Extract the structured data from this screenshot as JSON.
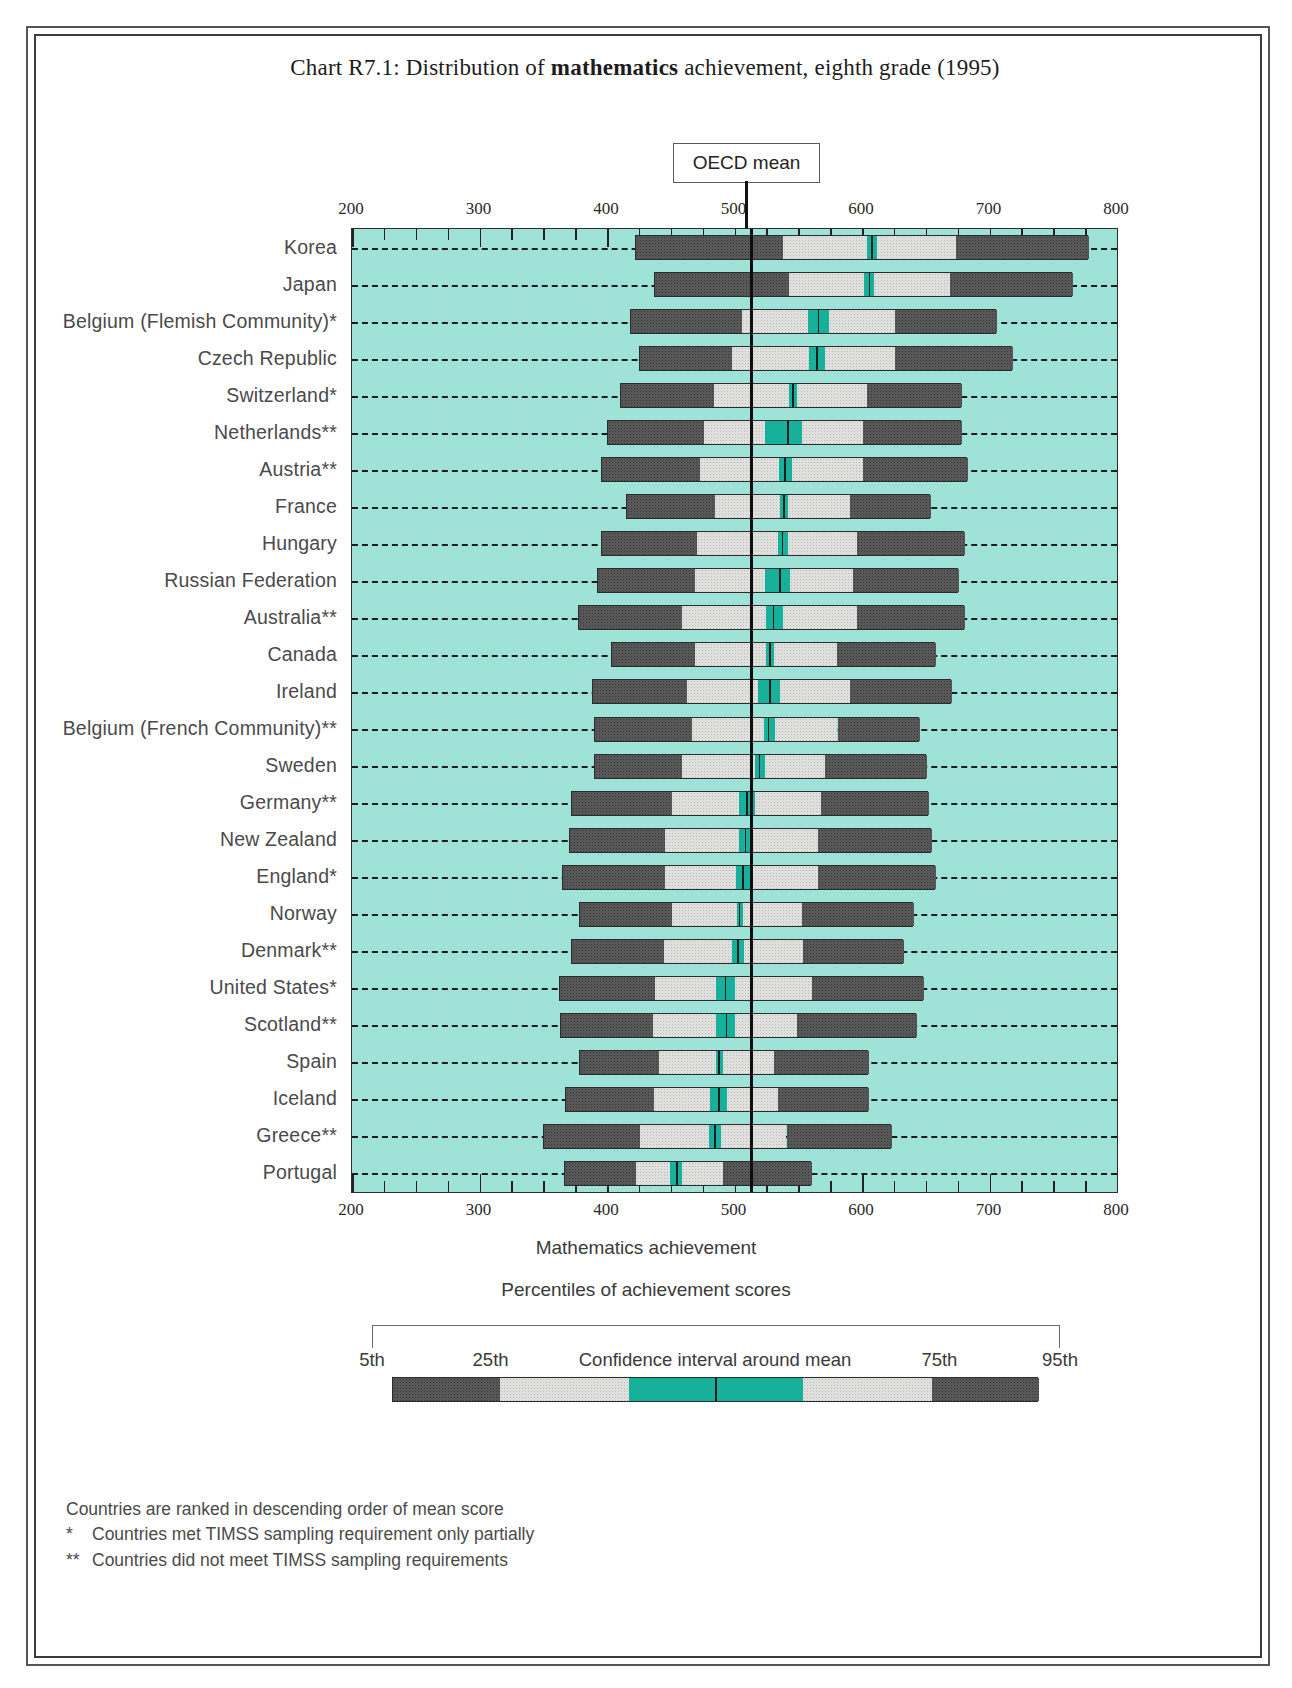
{
  "title": {
    "prefix": "Chart R7.1: Distribution of ",
    "bold": "mathematics",
    "suffix": " achievement, eighth grade (1995)"
  },
  "oecd_mean_label": "OECD mean",
  "axis": {
    "xlabel": "Mathematics achievement",
    "tick_labels": [
      "200",
      "300",
      "400",
      "500",
      "600",
      "700",
      "800"
    ]
  },
  "legend": {
    "caption": "Percentiles of achievement scores",
    "labels": [
      "5th",
      "25th",
      "Confidence interval around mean",
      "75th",
      "95th"
    ]
  },
  "notes": [
    {
      "mark": "",
      "text": "Countries are ranked in descending order of mean score"
    },
    {
      "mark": "*",
      "text": "Countries met TIMSS sampling requirement only partially"
    },
    {
      "mark": "**",
      "text": "Countries did not meet TIMSS sampling requirements"
    }
  ],
  "colors": {
    "plot_background": "#9fe3d8",
    "outer_percentile": "#575757",
    "inner_percentile": "#dfdfdd",
    "confidence_interval": "#17b09a",
    "mean_line": "#0d0d0d"
  },
  "chart_data": {
    "type": "bar",
    "title": "Chart R7.1: Distribution of mathematics achievement, eighth grade (1995)",
    "xlabel": "Mathematics achievement",
    "ylabel": "",
    "xlim": [
      200,
      800
    ],
    "grid": false,
    "legend_position": "bottom",
    "oecd_mean": 513,
    "percentile_keys": [
      "p5",
      "p25",
      "ci_low",
      "mean",
      "ci_high",
      "p75",
      "p95"
    ],
    "categories": [
      "Korea",
      "Japan",
      "Belgium (Flemish Community)*",
      "Czech Republic",
      "Switzerland*",
      "Netherlands**",
      "Austria**",
      "France",
      "Hungary",
      "Russian Federation",
      "Australia**",
      "Canada",
      "Ireland",
      "Belgium (French Community)**",
      "Sweden",
      "Germany**",
      "New Zealand",
      "England*",
      "Norway",
      "Denmark**",
      "United States*",
      "Scotland**",
      "Spain",
      "Iceland",
      "Greece**",
      "Portugal"
    ],
    "series": [
      {
        "name": "Korea",
        "p5": 422,
        "p25": 537,
        "ci_low": 603,
        "mean": 607,
        "ci_high": 611,
        "p75": 673,
        "p95": 777
      },
      {
        "name": "Japan",
        "p5": 437,
        "p25": 542,
        "ci_low": 601,
        "mean": 605,
        "ci_high": 609,
        "p75": 668,
        "p95": 765
      },
      {
        "name": "Belgium (Flemish Community)*",
        "p5": 418,
        "p25": 505,
        "ci_low": 557,
        "mean": 565,
        "ci_high": 573,
        "p75": 625,
        "p95": 705
      },
      {
        "name": "Czech Republic",
        "p5": 425,
        "p25": 497,
        "ci_low": 558,
        "mean": 564,
        "ci_high": 570,
        "p75": 625,
        "p95": 718
      },
      {
        "name": "Switzerland*",
        "p5": 410,
        "p25": 483,
        "ci_low": 542,
        "mean": 545,
        "ci_high": 548,
        "p75": 603,
        "p95": 678
      },
      {
        "name": "Netherlands**",
        "p5": 400,
        "p25": 475,
        "ci_low": 523,
        "mean": 541,
        "ci_high": 552,
        "p75": 600,
        "p95": 678
      },
      {
        "name": "Austria**",
        "p5": 395,
        "p25": 472,
        "ci_low": 534,
        "mean": 539,
        "ci_high": 544,
        "p75": 600,
        "p95": 682
      },
      {
        "name": "France",
        "p5": 415,
        "p25": 484,
        "ci_low": 535,
        "mean": 538,
        "ci_high": 541,
        "p75": 590,
        "p95": 653
      },
      {
        "name": "Hungary",
        "p5": 395,
        "p25": 470,
        "ci_low": 533,
        "mean": 537,
        "ci_high": 541,
        "p75": 595,
        "p95": 680
      },
      {
        "name": "Russian Federation",
        "p5": 392,
        "p25": 468,
        "ci_low": 523,
        "mean": 535,
        "ci_high": 543,
        "p75": 592,
        "p95": 675
      },
      {
        "name": "Australia**",
        "p5": 377,
        "p25": 458,
        "ci_low": 524,
        "mean": 530,
        "ci_high": 537,
        "p75": 595,
        "p95": 680
      },
      {
        "name": "Canada",
        "p5": 403,
        "p25": 468,
        "ci_low": 524,
        "mean": 527,
        "ci_high": 530,
        "p75": 580,
        "p95": 657
      },
      {
        "name": "Ireland",
        "p5": 388,
        "p25": 462,
        "ci_low": 518,
        "mean": 527,
        "ci_high": 535,
        "p75": 590,
        "p95": 670
      },
      {
        "name": "Belgium (French Community)**",
        "p5": 390,
        "p25": 466,
        "ci_low": 522,
        "mean": 526,
        "ci_high": 531,
        "p75": 580,
        "p95": 645
      },
      {
        "name": "Sweden",
        "p5": 390,
        "p25": 458,
        "ci_low": 515,
        "mean": 519,
        "ci_high": 523,
        "p75": 570,
        "p95": 650
      },
      {
        "name": "Germany**",
        "p5": 372,
        "p25": 450,
        "ci_low": 503,
        "mean": 509,
        "ci_high": 515,
        "p75": 567,
        "p95": 652
      },
      {
        "name": "New Zealand",
        "p5": 370,
        "p25": 445,
        "ci_low": 503,
        "mean": 508,
        "ci_high": 513,
        "p75": 565,
        "p95": 654
      },
      {
        "name": "England*",
        "p5": 365,
        "p25": 445,
        "ci_low": 500,
        "mean": 506,
        "ci_high": 512,
        "p75": 565,
        "p95": 657
      },
      {
        "name": "Norway",
        "p5": 378,
        "p25": 450,
        "ci_low": 501,
        "mean": 503,
        "ci_high": 506,
        "p75": 552,
        "p95": 640
      },
      {
        "name": "Denmark**",
        "p5": 372,
        "p25": 444,
        "ci_low": 497,
        "mean": 502,
        "ci_high": 507,
        "p75": 553,
        "p95": 632
      },
      {
        "name": "United States*",
        "p5": 362,
        "p25": 437,
        "ci_low": 485,
        "mean": 492,
        "ci_high": 500,
        "p75": 560,
        "p95": 648
      },
      {
        "name": "Scotland**",
        "p5": 363,
        "p25": 435,
        "ci_low": 485,
        "mean": 493,
        "ci_high": 500,
        "p75": 548,
        "p95": 642
      },
      {
        "name": "Spain",
        "p5": 378,
        "p25": 440,
        "ci_low": 485,
        "mean": 487,
        "ci_high": 490,
        "p75": 530,
        "p95": 605
      },
      {
        "name": "Iceland",
        "p5": 367,
        "p25": 436,
        "ci_low": 480,
        "mean": 487,
        "ci_high": 493,
        "p75": 533,
        "p95": 605
      },
      {
        "name": "Greece**",
        "p5": 350,
        "p25": 425,
        "ci_low": 479,
        "mean": 484,
        "ci_high": 489,
        "p75": 540,
        "p95": 623
      },
      {
        "name": "Portugal",
        "p5": 366,
        "p25": 422,
        "ci_low": 449,
        "mean": 454,
        "ci_high": 458,
        "p75": 490,
        "p95": 560
      }
    ]
  }
}
